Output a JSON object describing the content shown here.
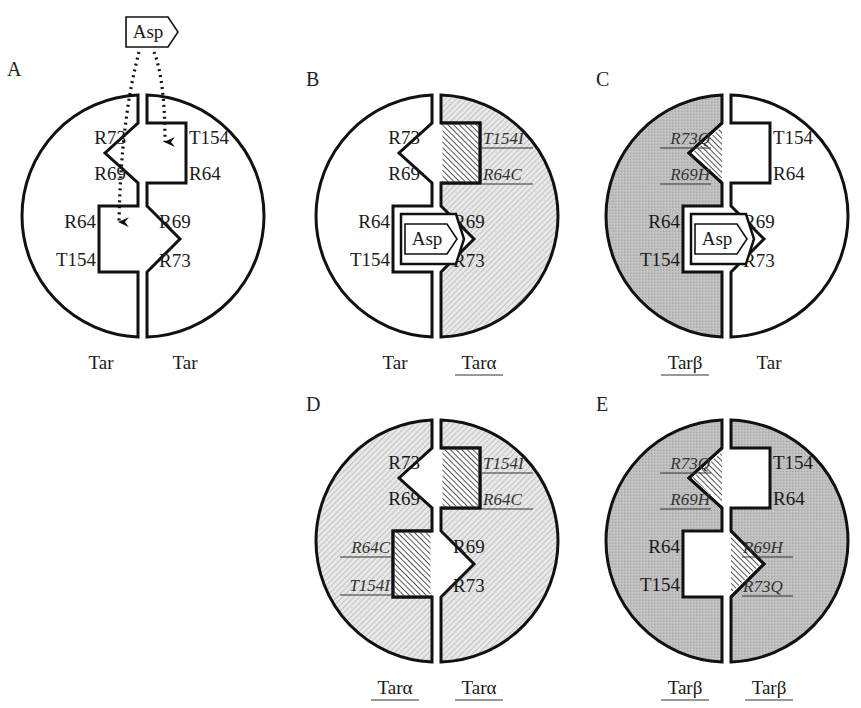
{
  "figure": {
    "ligand": "Asp",
    "panels": [
      {
        "id": "A",
        "letter": "A",
        "left": {
          "name": "Tar",
          "underline": false,
          "fill": "white",
          "labels": {
            "top1": "R73",
            "top2": "R69",
            "bot1": "R64",
            "bot2": "T154"
          },
          "mutant": false
        },
        "right": {
          "name": "Tar",
          "underline": false,
          "fill": "white",
          "labels": {
            "top1": "T154",
            "top2": "R64",
            "bot1": "R69",
            "bot2": "R73"
          },
          "mutant": false
        },
        "asp_bound": false,
        "asp_external": true
      },
      {
        "id": "B",
        "letter": "B",
        "left": {
          "name": "Tar",
          "underline": false,
          "fill": "white",
          "labels": {
            "top1": "R73",
            "top2": "R69",
            "bot1": "R64",
            "bot2": "T154"
          },
          "mutant": false
        },
        "right": {
          "name": "Tarα",
          "underline": true,
          "fill": "hatch-light",
          "labels": {
            "top1": "T154I",
            "top2": "R64C",
            "bot1": "R69",
            "bot2": "R73"
          },
          "mutant": "alpha"
        },
        "asp_bound": true
      },
      {
        "id": "C",
        "letter": "C",
        "left": {
          "name": "Tarβ",
          "underline": true,
          "fill": "gray",
          "labels": {
            "top1": "R73Q",
            "top2": "R69H",
            "bot1": "R64",
            "bot2": "T154"
          },
          "mutant": "beta"
        },
        "right": {
          "name": "Tar",
          "underline": false,
          "fill": "white",
          "labels": {
            "top1": "T154",
            "top2": "R64",
            "bot1": "R69",
            "bot2": "R73"
          },
          "mutant": false
        },
        "asp_bound": true
      },
      {
        "id": "D",
        "letter": "D",
        "left": {
          "name": "Tarα",
          "underline": true,
          "fill": "hatch-light",
          "labels": {
            "top1": "R73",
            "top2": "R69",
            "bot1": "R64C",
            "bot2": "T154I"
          },
          "mutant": "alpha"
        },
        "right": {
          "name": "Tarα",
          "underline": true,
          "fill": "hatch-light",
          "labels": {
            "top1": "T154I",
            "top2": "R64C",
            "bot1": "R69",
            "bot2": "R73"
          },
          "mutant": "alpha"
        },
        "asp_bound": false
      },
      {
        "id": "E",
        "letter": "E",
        "left": {
          "name": "Tarβ",
          "underline": true,
          "fill": "gray",
          "labels": {
            "top1": "R73Q",
            "top2": "R69H",
            "bot1": "R64",
            "bot2": "T154"
          },
          "mutant": "beta"
        },
        "right": {
          "name": "Tarβ",
          "underline": true,
          "fill": "gray",
          "labels": {
            "top1": "T154",
            "top2": "R64",
            "bot1": "R69H",
            "bot2": "R73Q"
          },
          "mutant": "beta"
        },
        "asp_bound": false
      }
    ]
  },
  "colors": {
    "outline": "#111111",
    "gray_fill": "#b9b9b9",
    "hatch_light_bg": "#e6e6e6",
    "hatch_light_line": "#b0b0b0",
    "hatch_dark_line": "#333333",
    "background": "#ffffff"
  }
}
